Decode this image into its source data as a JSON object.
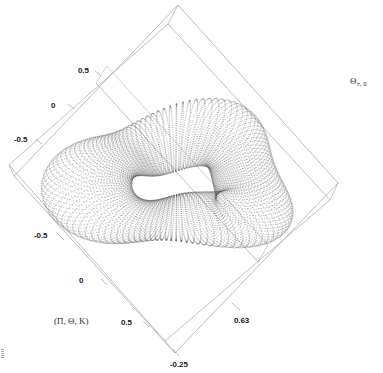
{
  "figure": {
    "kind": "3d-parametric-surface-dot-plot",
    "background_color": "#ffffff",
    "frame_color": "#9a9a9a",
    "dot_color": "#555555",
    "axis_label_left": "(Π, Θ, Κ)",
    "axis_label_right_base": "Θ",
    "axis_label_right_sub": "±, 0"
  },
  "ticks": {
    "left_upper": [
      {
        "label": "0.5",
        "x": 78,
        "y": 66
      },
      {
        "label": "0",
        "x": 51,
        "y": 101
      },
      {
        "label": "-0.5",
        "x": 14,
        "y": 135
      }
    ],
    "left_lower": [
      {
        "label": "-0.5",
        "x": 34,
        "y": 231
      },
      {
        "label": "0",
        "x": 79,
        "y": 276
      },
      {
        "label": "0.5",
        "x": 121,
        "y": 318
      }
    ],
    "right": [
      {
        "label": "0.63",
        "x": 234,
        "y": 316
      }
    ],
    "bottom": [
      {
        "label": "-0.25",
        "x": 170,
        "y": 360
      }
    ]
  },
  "chart_data": {
    "type": "scatter",
    "title": "",
    "xlabel": "(Π, Θ, Κ)",
    "ylabel": "",
    "zlabel": "Θ",
    "grid": false,
    "legend": null,
    "projection": "3d-parallel",
    "tick_labels": {
      "axis_u": [
        "0.5",
        "0",
        "-0.5"
      ],
      "axis_v": [
        "-0.5",
        "0",
        "0.5"
      ],
      "axis_w_max": "0.63",
      "axis_w_min": "-0.25"
    },
    "axis_u_range": [
      -0.5,
      0.5
    ],
    "axis_v_range": [
      -0.5,
      0.5
    ],
    "axis_w_range": [
      -0.25,
      0.63
    ],
    "surface": {
      "family": "torus-like closed surface",
      "u_samples": 120,
      "v_samples": 80,
      "u_range": [
        0,
        6.2832
      ],
      "v_range": [
        0,
        6.2832
      ],
      "render": "dots"
    },
    "box_vertices_px": {
      "top": [
        178,
        5
      ],
      "left": [
        14,
        176
      ],
      "right": [
        338,
        183
      ],
      "bottom": [
        175,
        353
      ]
    }
  }
}
